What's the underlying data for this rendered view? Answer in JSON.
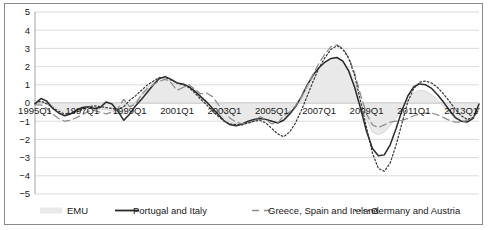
{
  "chart_data": {
    "type": "line",
    "title": "",
    "subtitle": "",
    "xlabel": "",
    "ylabel": "",
    "ylim": [
      -5,
      5
    ],
    "yticks": [
      5,
      4,
      3,
      2,
      1,
      0,
      -1,
      -2,
      -3,
      -4,
      -5
    ],
    "grid": true,
    "legend_position": "bottom",
    "x_tick_labels": [
      "1995Q1",
      "1997Q1",
      "1999Q1",
      "2001Q1",
      "2003Q1",
      "2005Q1",
      "2007Q1",
      "2009Q1",
      "2011Q1",
      "2013Q1"
    ],
    "x_tick_indices": [
      0,
      8,
      16,
      24,
      32,
      40,
      48,
      56,
      64,
      72
    ],
    "x": [
      "1995Q1",
      "1995Q2",
      "1995Q3",
      "1995Q4",
      "1996Q1",
      "1996Q2",
      "1996Q3",
      "1996Q4",
      "1997Q1",
      "1997Q2",
      "1997Q3",
      "1997Q4",
      "1998Q1",
      "1998Q2",
      "1998Q3",
      "1998Q4",
      "1999Q1",
      "1999Q2",
      "1999Q3",
      "1999Q4",
      "2000Q1",
      "2000Q2",
      "2000Q3",
      "2000Q4",
      "2001Q1",
      "2001Q2",
      "2001Q3",
      "2001Q4",
      "2002Q1",
      "2002Q2",
      "2002Q3",
      "2002Q4",
      "2003Q1",
      "2003Q2",
      "2003Q3",
      "2003Q4",
      "2004Q1",
      "2004Q2",
      "2004Q3",
      "2004Q4",
      "2005Q1",
      "2005Q2",
      "2005Q3",
      "2005Q4",
      "2006Q1",
      "2006Q2",
      "2006Q3",
      "2006Q4",
      "2007Q1",
      "2007Q2",
      "2007Q3",
      "2007Q4",
      "2008Q1",
      "2008Q2",
      "2008Q3",
      "2008Q4",
      "2009Q1",
      "2009Q2",
      "2009Q3",
      "2009Q4",
      "2010Q1",
      "2010Q2",
      "2010Q3",
      "2010Q4",
      "2011Q1",
      "2011Q2",
      "2011Q3",
      "2011Q4",
      "2012Q1",
      "2012Q2",
      "2012Q3",
      "2012Q4",
      "2013Q1",
      "2013Q2",
      "2013Q3",
      "2013Q4"
    ],
    "series": [
      {
        "name": "EMU",
        "style": "area",
        "color": "#e9e9e9",
        "edge_color": "#c8c8c8",
        "values": [
          -0.05,
          0.05,
          0.0,
          -0.15,
          -0.35,
          -0.5,
          -0.55,
          -0.5,
          -0.4,
          -0.3,
          -0.3,
          -0.35,
          -0.35,
          -0.45,
          -0.6,
          -0.6,
          -0.3,
          0.1,
          0.5,
          0.9,
          1.2,
          1.4,
          1.35,
          1.15,
          1.0,
          0.95,
          0.85,
          0.6,
          0.3,
          0.0,
          -0.3,
          -0.6,
          -0.85,
          -1.05,
          -1.15,
          -1.15,
          -1.05,
          -0.95,
          -0.9,
          -0.95,
          -1.0,
          -1.05,
          -0.95,
          -0.7,
          -0.3,
          0.2,
          0.8,
          1.4,
          1.9,
          2.25,
          2.45,
          2.5,
          2.35,
          1.9,
          1.1,
          0.1,
          -0.9,
          -1.6,
          -1.75,
          -1.6,
          -1.25,
          -0.8,
          -0.3,
          0.2,
          0.55,
          0.7,
          0.65,
          0.45,
          0.15,
          -0.2,
          -0.55,
          -0.85,
          -1.0,
          -1.0,
          -0.8,
          -0.35
        ]
      },
      {
        "name": "Portugal and Italy",
        "style": "solid",
        "color": "#2a2a2a",
        "values": [
          -0.05,
          0.25,
          0.1,
          -0.3,
          -0.55,
          -0.7,
          -0.6,
          -0.4,
          -0.25,
          -0.2,
          -0.3,
          -0.25,
          0.05,
          -0.05,
          -0.45,
          -0.95,
          -0.6,
          -0.15,
          0.2,
          0.6,
          1.0,
          1.35,
          1.45,
          1.3,
          1.1,
          1.05,
          0.9,
          0.65,
          0.35,
          0.05,
          -0.3,
          -0.65,
          -1.0,
          -1.2,
          -1.25,
          -1.15,
          -1.0,
          -0.9,
          -0.85,
          -0.9,
          -1.0,
          -1.1,
          -0.95,
          -0.6,
          -0.2,
          0.35,
          1.0,
          1.55,
          1.95,
          2.25,
          2.45,
          2.5,
          2.3,
          1.75,
          0.85,
          -0.3,
          -1.55,
          -2.5,
          -2.9,
          -2.85,
          -2.3,
          -1.4,
          -0.4,
          0.4,
          0.9,
          1.05,
          1.0,
          0.8,
          0.45,
          0.05,
          -0.4,
          -0.8,
          -1.0,
          -1.05,
          -0.85,
          -0.05
        ]
      },
      {
        "name": "Greece, Spain and Ireland",
        "style": "dashed",
        "color": "#8e8e8e",
        "values": [
          -0.1,
          -0.1,
          -0.3,
          -0.6,
          -0.85,
          -1.0,
          -0.95,
          -0.8,
          -0.65,
          -0.45,
          -0.4,
          -0.5,
          -0.6,
          -0.5,
          -0.3,
          0.2,
          -0.2,
          -0.05,
          0.45,
          0.8,
          1.0,
          1.2,
          1.3,
          1.1,
          0.7,
          0.85,
          1.0,
          0.75,
          0.5,
          0.55,
          0.35,
          -0.1,
          -0.5,
          -0.85,
          -1.05,
          -1.15,
          -1.1,
          -1.0,
          -0.75,
          -0.9,
          -1.15,
          -1.1,
          -0.7,
          -0.5,
          -0.15,
          0.35,
          0.95,
          1.6,
          2.2,
          2.7,
          3.1,
          3.2,
          3.0,
          2.5,
          1.65,
          0.45,
          -0.6,
          -1.2,
          -1.35,
          -1.2,
          -1.05,
          -1.0,
          -0.95,
          -0.85,
          -0.7,
          -0.6,
          -0.55,
          -0.55,
          -0.65,
          -0.8,
          -0.95,
          -1.05,
          -1.05,
          -0.95,
          -0.8,
          -0.4
        ]
      },
      {
        "name": "Germany and Austria",
        "style": "dotted",
        "color": "#3a3a3a",
        "values": [
          0.0,
          0.1,
          -0.05,
          -0.25,
          -0.45,
          -0.6,
          -0.6,
          -0.5,
          -0.35,
          -0.2,
          -0.15,
          -0.2,
          -0.25,
          -0.3,
          -0.35,
          -0.2,
          0.15,
          0.4,
          0.7,
          1.0,
          1.2,
          1.4,
          1.4,
          1.25,
          1.1,
          1.0,
          0.85,
          0.55,
          0.2,
          -0.1,
          -0.45,
          -0.75,
          -1.0,
          -1.15,
          -1.2,
          -1.2,
          -1.1,
          -1.0,
          -0.95,
          -1.1,
          -1.4,
          -1.7,
          -1.85,
          -1.6,
          -1.1,
          -0.4,
          0.4,
          1.2,
          1.95,
          2.5,
          2.95,
          3.15,
          2.95,
          2.45,
          1.5,
          0.1,
          -1.35,
          -2.75,
          -3.6,
          -3.75,
          -3.3,
          -2.3,
          -1.1,
          0.1,
          0.8,
          1.15,
          1.2,
          1.1,
          0.85,
          0.5,
          0.1,
          -0.35,
          -0.7,
          -0.9,
          -0.8,
          -0.3
        ]
      }
    ]
  },
  "legend": {
    "items": [
      {
        "label": "EMU",
        "marker": "area-swatch"
      },
      {
        "label": "Portugal and Italy",
        "marker": "solid-line"
      },
      {
        "label": "Greece, Spain and Ireland",
        "marker": "dashed-line"
      },
      {
        "label": "Germany and Austria",
        "marker": "dotted-line"
      }
    ]
  }
}
